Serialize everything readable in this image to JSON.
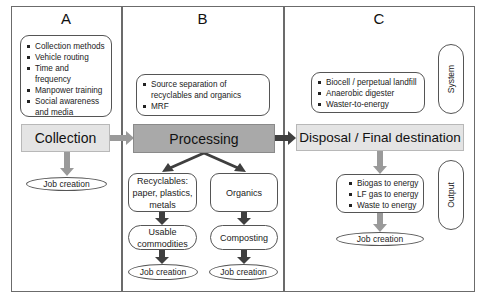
{
  "columns": [
    {
      "id": "A",
      "title": "A"
    },
    {
      "id": "B",
      "title": "B"
    },
    {
      "id": "C",
      "title": "C"
    }
  ],
  "col_a": {
    "list": [
      "Collection methods",
      "Vehicle routing",
      "Time and frequency",
      "Manpower training",
      "Social awareness and media"
    ],
    "stage": "Collection",
    "job": "Job creation"
  },
  "col_b": {
    "list": [
      "Source separation of recyclables and organics",
      "MRF"
    ],
    "stage": "Processing",
    "left_branch": {
      "category": "Recyclables: paper, plastics, metals",
      "product": "Usable commodities",
      "job": "Job creation"
    },
    "right_branch": {
      "category": "Organics",
      "product": "Composting",
      "job": "Job creation"
    }
  },
  "col_c": {
    "system_label": "System",
    "system_list": [
      "Biocell / perpetual landfill",
      "Anaerobic digester",
      "Waster-to-energy"
    ],
    "stage": "Disposal / Final destination",
    "output_label": "Output",
    "output_list": [
      "Biogas to energy",
      "LF gas to energy",
      "Waste to energy"
    ],
    "job": "Job creation"
  },
  "colors": {
    "frame": "#6b6b6b",
    "stage_light": "#e4e4e4",
    "stage_dark": "#a9a9a9",
    "arrow_light": "#9a9a9a",
    "arrow_dark": "#3f3f3f"
  }
}
